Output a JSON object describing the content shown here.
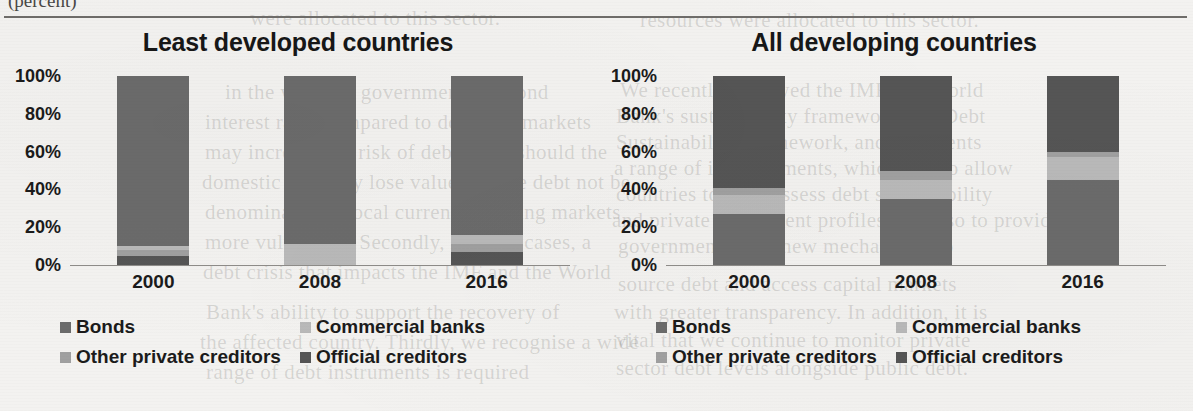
{
  "page": {
    "clipped_top_text": "(percent)",
    "ghost_lines": [
      {
        "text": "were allocated to this sector.",
        "x": 250,
        "y": 6
      },
      {
        "text": "resources were allocated to this sector.",
        "x": 640,
        "y": 8
      },
      {
        "text": "We recently reviewed the IMF and World",
        "x": 620,
        "y": 78
      },
      {
        "text": "Bank's sustainability framework, the Debt",
        "x": 616,
        "y": 104
      },
      {
        "text": "Sustainability Framework, and it presents",
        "x": 616,
        "y": 130
      },
      {
        "text": "a range of improvements, which is also allow",
        "x": 614,
        "y": 156
      },
      {
        "text": "countries to fully assess debt sustainability",
        "x": 616,
        "y": 182
      },
      {
        "text": "and private investment profiles, but also to provide",
        "x": 612,
        "y": 208
      },
      {
        "text": "governments with new mechanisms to",
        "x": 618,
        "y": 234
      },
      {
        "text": "source debt and access capital markets",
        "x": 618,
        "y": 272
      },
      {
        "text": "with greater transparency. In addition, it is",
        "x": 614,
        "y": 300
      },
      {
        "text": "vital that we continue to monitor private",
        "x": 616,
        "y": 328
      },
      {
        "text": "sector debt levels alongside public debt.",
        "x": 616,
        "y": 356
      },
      {
        "text": "in the way that governments respond",
        "x": 225,
        "y": 80
      },
      {
        "text": "interest rates compared to domestic markets",
        "x": 205,
        "y": 110
      },
      {
        "text": "may increase the risk of debt crisis should the",
        "x": 205,
        "y": 140
      },
      {
        "text": "domestic currency lose value and the debt not be",
        "x": 202,
        "y": 170
      },
      {
        "text": "denominated in local currency, leaving markets",
        "x": 205,
        "y": 200
      },
      {
        "text": "more vulnerable. Secondly, in these cases, a",
        "x": 205,
        "y": 230
      },
      {
        "text": "debt crisis that impacts the IMF and the World",
        "x": 203,
        "y": 260
      },
      {
        "text": "Bank's ability to support the recovery of",
        "x": 206,
        "y": 300
      },
      {
        "text": "the affected country. Thirdly, we recognise a wide",
        "x": 200,
        "y": 330
      },
      {
        "text": "range of debt instruments is required",
        "x": 206,
        "y": 360
      }
    ]
  },
  "colors": {
    "bonds": "#6b6b6b",
    "commercial_banks": "#b9b9b9",
    "other_private_creditors": "#a0a0a0",
    "official_creditors": "#555555",
    "axis": "#8e8c89",
    "text": "#1b1b1b"
  },
  "legend": {
    "items": [
      {
        "label": "Bonds",
        "color_key": "bonds",
        "icon": "legend-swatch-icon"
      },
      {
        "label": "Commercial banks",
        "color_key": "commercial_banks",
        "icon": "legend-swatch-icon"
      },
      {
        "label": "Other private creditors",
        "color_key": "other_private_creditors",
        "icon": "legend-swatch-icon"
      },
      {
        "label": "Official creditors",
        "color_key": "official_creditors",
        "icon": "legend-swatch-icon"
      }
    ]
  },
  "chart_data": [
    {
      "type": "bar",
      "stacked": true,
      "stack_mode": "percent",
      "title": "Least developed countries",
      "xlabel": "",
      "ylabel": "",
      "ylim": [
        0,
        100
      ],
      "yticks": [
        "0%",
        "20%",
        "40%",
        "60%",
        "80%",
        "100%"
      ],
      "grid": false,
      "legend_position": "bottom",
      "categories": [
        "2000",
        "2008",
        "2016"
      ],
      "series": [
        {
          "name": "Official creditors",
          "values": [
            5,
            0,
            7
          ]
        },
        {
          "name": "Other private creditors",
          "values": [
            3,
            0,
            4
          ]
        },
        {
          "name": "Commercial banks",
          "values": [
            2,
            11,
            5
          ]
        },
        {
          "name": "Bonds",
          "values": [
            90,
            89,
            84
          ]
        }
      ]
    },
    {
      "type": "bar",
      "stacked": true,
      "stack_mode": "percent",
      "title": "All developing countries",
      "xlabel": "",
      "ylabel": "",
      "ylim": [
        0,
        100
      ],
      "yticks": [
        "0%",
        "20%",
        "40%",
        "60%",
        "80%",
        "100%"
      ],
      "grid": false,
      "legend_position": "bottom",
      "categories": [
        "2000",
        "2008",
        "2016"
      ],
      "series": [
        {
          "name": "Bonds",
          "values": [
            27,
            35,
            45
          ]
        },
        {
          "name": "Commercial banks",
          "values": [
            10,
            10,
            12
          ]
        },
        {
          "name": "Other private creditors",
          "values": [
            4,
            5,
            3
          ]
        },
        {
          "name": "Official creditors",
          "values": [
            59,
            50,
            40
          ]
        }
      ]
    }
  ]
}
